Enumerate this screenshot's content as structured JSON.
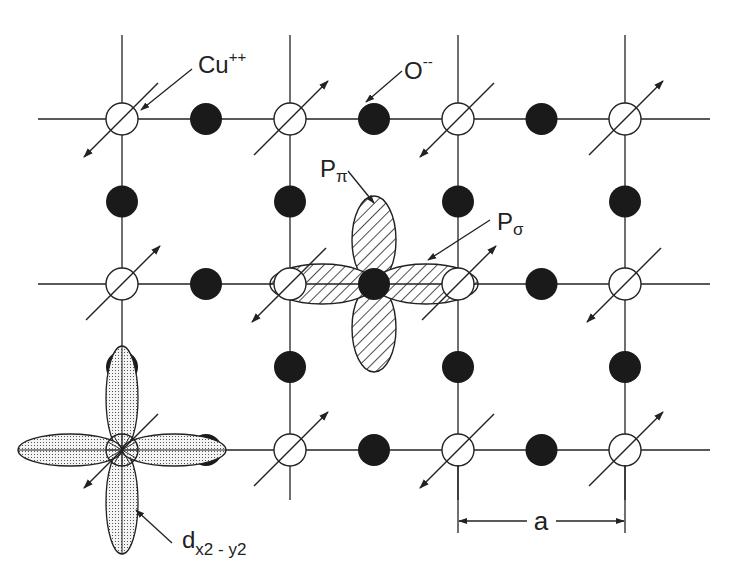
{
  "colors": {
    "ink": "#222222",
    "oxygen": "#1a1a1a",
    "background": "#ffffff",
    "d_orbital_fill": "#e6e6e6"
  },
  "lattice": {
    "columns_x": [
      122,
      290,
      458,
      625
    ],
    "rows_y": [
      119,
      284,
      450
    ],
    "h_line_extent": [
      38,
      710
    ],
    "v_line_extent": [
      35,
      500
    ],
    "cu_radius": 16,
    "o_radius": 16
  },
  "cu_sites": [
    {
      "row": 0,
      "col": 0,
      "spin": "down"
    },
    {
      "row": 0,
      "col": 1,
      "spin": "up"
    },
    {
      "row": 0,
      "col": 2,
      "spin": "down"
    },
    {
      "row": 0,
      "col": 3,
      "spin": "up"
    },
    {
      "row": 1,
      "col": 0,
      "spin": "up"
    },
    {
      "row": 1,
      "col": 1,
      "spin": "down"
    },
    {
      "row": 1,
      "col": 2,
      "spin": "up"
    },
    {
      "row": 1,
      "col": 3,
      "spin": "down"
    },
    {
      "row": 2,
      "col": 0,
      "spin": "down"
    },
    {
      "row": 2,
      "col": 1,
      "spin": "up"
    },
    {
      "row": 2,
      "col": 2,
      "spin": "down"
    },
    {
      "row": 2,
      "col": 3,
      "spin": "up"
    }
  ],
  "labels": {
    "cu": {
      "base": "Cu",
      "sup": "++"
    },
    "o": {
      "base": "O",
      "sup": "--"
    },
    "p_pi": {
      "base": "P",
      "sub": "π"
    },
    "p_sigma": {
      "base": "P",
      "sub": "σ"
    },
    "d_orbital": {
      "base": "d",
      "sub": "x2 - y2"
    },
    "lattice_constant": "a"
  }
}
